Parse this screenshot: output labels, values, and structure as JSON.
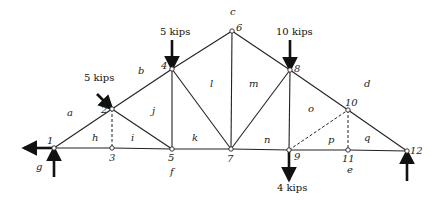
{
  "figure": {
    "type": "truss",
    "joints": [
      {
        "id": "1",
        "x": 54,
        "y": 148,
        "lx": 47,
        "ly": 144
      },
      {
        "id": "2",
        "x": 112,
        "y": 109,
        "lx": 101,
        "ly": 113
      },
      {
        "id": "3",
        "x": 112,
        "y": 148,
        "lx": 109,
        "ly": 161
      },
      {
        "id": "4",
        "x": 172,
        "y": 69,
        "lx": 161,
        "ly": 69
      },
      {
        "id": "5",
        "x": 172,
        "y": 149,
        "lx": 168,
        "ly": 161
      },
      {
        "id": "6",
        "x": 232,
        "y": 31,
        "lx": 236,
        "ly": 31
      },
      {
        "id": "7",
        "x": 231,
        "y": 149,
        "lx": 227,
        "ly": 162
      },
      {
        "id": "8",
        "x": 290,
        "y": 70,
        "lx": 294,
        "ly": 72
      },
      {
        "id": "9",
        "x": 289,
        "y": 150,
        "lx": 294,
        "ly": 160
      },
      {
        "id": "10",
        "x": 348,
        "y": 110,
        "lx": 345,
        "ly": 106
      },
      {
        "id": "11",
        "x": 348,
        "y": 150,
        "lx": 342,
        "ly": 162
      },
      {
        "id": "12",
        "x": 407,
        "y": 151,
        "lx": 410,
        "ly": 154
      }
    ],
    "members_solid": [
      [
        "1",
        "2"
      ],
      [
        "2",
        "4"
      ],
      [
        "4",
        "6"
      ],
      [
        "6",
        "8"
      ],
      [
        "8",
        "10"
      ],
      [
        "10",
        "12"
      ],
      [
        "1",
        "3"
      ],
      [
        "3",
        "5"
      ],
      [
        "5",
        "7"
      ],
      [
        "7",
        "9"
      ],
      [
        "9",
        "11"
      ],
      [
        "11",
        "12"
      ],
      [
        "2",
        "5"
      ],
      [
        "4",
        "5"
      ],
      [
        "4",
        "7"
      ],
      [
        "6",
        "7"
      ],
      [
        "8",
        "7"
      ],
      [
        "8",
        "9"
      ]
    ],
    "members_dashed": [
      [
        "2",
        "3"
      ],
      [
        "9",
        "10"
      ],
      [
        "10",
        "11"
      ]
    ],
    "region_labels": [
      {
        "t": "a",
        "x": 67,
        "y": 116
      },
      {
        "t": "b",
        "x": 138,
        "y": 74
      },
      {
        "t": "c",
        "x": 230,
        "y": 15
      },
      {
        "t": "d",
        "x": 364,
        "y": 87
      },
      {
        "t": "e",
        "x": 347,
        "y": 173
      },
      {
        "t": "f",
        "x": 170,
        "y": 175
      },
      {
        "t": "g",
        "x": 36,
        "y": 170
      },
      {
        "t": "h",
        "x": 92,
        "y": 141
      },
      {
        "t": "i",
        "x": 131,
        "y": 141
      },
      {
        "t": "j",
        "x": 152,
        "y": 114
      },
      {
        "t": "k",
        "x": 192,
        "y": 141
      },
      {
        "t": "l",
        "x": 210,
        "y": 87
      },
      {
        "t": "m",
        "x": 249,
        "y": 87
      },
      {
        "t": "n",
        "x": 264,
        "y": 143
      },
      {
        "t": "o",
        "x": 308,
        "y": 112
      },
      {
        "t": "p",
        "x": 328,
        "y": 143
      },
      {
        "t": "q",
        "x": 364,
        "y": 141
      }
    ],
    "loads": [
      {
        "label": "5 kips",
        "x1": 97,
        "y1": 94,
        "x2": 112,
        "y2": 109,
        "lx": 84,
        "ly": 81
      },
      {
        "label": "5 kips",
        "x1": 172,
        "y1": 40,
        "x2": 172,
        "y2": 69,
        "lx": 160,
        "ly": 35
      },
      {
        "label": "10 kips",
        "x1": 290,
        "y1": 40,
        "x2": 290,
        "y2": 70,
        "lx": 276,
        "ly": 35
      },
      {
        "label": "4 kips",
        "x1": 289,
        "y1": 150,
        "x2": 289,
        "y2": 180,
        "lx": 277,
        "ly": 191
      }
    ],
    "reactions": [
      {
        "name": "horizontal-reaction-1",
        "x1": 54,
        "y1": 148,
        "x2": 24,
        "y2": 148
      },
      {
        "name": "vertical-reaction-1",
        "x1": 54,
        "y1": 177,
        "x2": 54,
        "y2": 148
      },
      {
        "name": "vertical-reaction-12",
        "x1": 407,
        "y1": 181,
        "x2": 407,
        "y2": 151
      }
    ]
  }
}
